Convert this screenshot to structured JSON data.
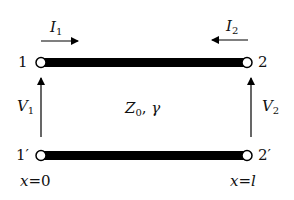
{
  "diagram": {
    "line_parameters": {
      "impedance": "Z",
      "impedance_sub": "0",
      "separator": ", ",
      "propagation": "γ"
    },
    "ports": {
      "port1_top": "1",
      "port1_bottom": "1′",
      "port2_top": "2",
      "port2_bottom": "2′"
    },
    "currents": {
      "I1": {
        "symbol": "I",
        "sub": "1",
        "direction": "right"
      },
      "I2": {
        "symbol": "I",
        "sub": "2",
        "direction": "left"
      }
    },
    "voltages": {
      "V1": {
        "symbol": "V",
        "sub": "1"
      },
      "V2": {
        "symbol": "V",
        "sub": "2"
      }
    },
    "positions": {
      "left": {
        "var": "x",
        "eq": "=",
        "val": "0"
      },
      "right": {
        "var": "x",
        "eq": "=",
        "val": "l"
      }
    },
    "colors": {
      "conductor": "#000000",
      "background": "#ffffff"
    }
  }
}
